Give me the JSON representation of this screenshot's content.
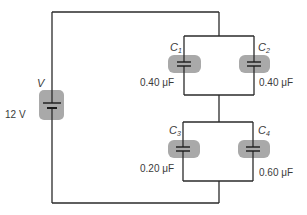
{
  "diagram": {
    "type": "circuit",
    "source": {
      "name": "V",
      "voltage": "12 V"
    },
    "capacitors": [
      {
        "name": "C",
        "sub": "1",
        "value": "0.40 μF",
        "group": "top-parallel"
      },
      {
        "name": "C",
        "sub": "2",
        "value": "0.40 μF",
        "group": "top-parallel"
      },
      {
        "name": "C",
        "sub": "3",
        "value": "0.20 μF",
        "group": "bottom-parallel"
      },
      {
        "name": "C",
        "sub": "4",
        "value": "0.60 μF",
        "group": "bottom-parallel"
      }
    ],
    "colors": {
      "wire": "#2a2a2a",
      "highlight": "#a9a9a9",
      "text": "#3a3a3a"
    }
  }
}
